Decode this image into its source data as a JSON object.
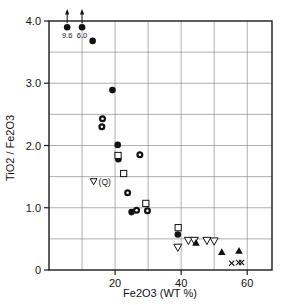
{
  "chart_data": {
    "type": "scatter",
    "title": "",
    "xlabel": "Fe2O3 (WT %)",
    "ylabel": "TiO2 / Fe2O3",
    "xlim": [
      0,
      67.5
    ],
    "ylim": [
      0,
      4.0
    ],
    "xticks": [
      20,
      40,
      60
    ],
    "xticklabels": [
      "20",
      "40",
      "60"
    ],
    "yticks": [
      0,
      1.0,
      2.0,
      3.0,
      4.0
    ],
    "yticklabels": [
      "0",
      "1.0",
      "2.0",
      "3.0",
      "4.0"
    ],
    "grid": "both, major every 10 on x and every 0.5 on y",
    "legend_position": "inside, left-middle",
    "annotations": [
      {
        "text": "9.6",
        "x": 5.5,
        "y": 3.9,
        "note": "off-scale value, arrow up"
      },
      {
        "text": "6.0",
        "x": 10.0,
        "y": 3.9,
        "note": "off-scale value, arrow up"
      },
      {
        "text": "(Q)",
        "x": 13.5,
        "y": 1.42,
        "note": "legend marker open triangle-down"
      }
    ],
    "series": [
      {
        "name": "filled-circle",
        "marker": "filled circle",
        "points": [
          {
            "x": 5.5,
            "y": 3.9
          },
          {
            "x": 10.0,
            "y": 3.9
          },
          {
            "x": 13.2,
            "y": 3.68
          },
          {
            "x": 19.2,
            "y": 2.89
          },
          {
            "x": 20.8,
            "y": 2.01
          },
          {
            "x": 21.0,
            "y": 1.78
          },
          {
            "x": 25.0,
            "y": 0.93
          },
          {
            "x": 39.0,
            "y": 0.57
          }
        ]
      },
      {
        "name": "dotted-circle",
        "marker": "filled circle with white center dot",
        "points": [
          {
            "x": 16.2,
            "y": 2.43
          },
          {
            "x": 16.0,
            "y": 2.3
          },
          {
            "x": 27.5,
            "y": 1.85
          },
          {
            "x": 23.8,
            "y": 1.24
          },
          {
            "x": 26.5,
            "y": 0.96
          },
          {
            "x": 29.8,
            "y": 0.95
          }
        ]
      },
      {
        "name": "open-square",
        "marker": "open square",
        "points": [
          {
            "x": 20.9,
            "y": 1.84
          },
          {
            "x": 22.6,
            "y": 1.55
          },
          {
            "x": 29.3,
            "y": 1.07
          },
          {
            "x": 39.1,
            "y": 0.68
          }
        ]
      },
      {
        "name": "open-triangle-down",
        "marker": "open triangle pointing down",
        "points": [
          {
            "x": 39.0,
            "y": 0.36
          },
          {
            "x": 42.2,
            "y": 0.47
          },
          {
            "x": 44.0,
            "y": 0.47
          },
          {
            "x": 47.8,
            "y": 0.47
          },
          {
            "x": 50.0,
            "y": 0.46
          }
        ]
      },
      {
        "name": "filled-triangle-up",
        "marker": "filled triangle pointing up",
        "points": [
          {
            "x": 44.5,
            "y": 0.44
          },
          {
            "x": 52.3,
            "y": 0.29
          },
          {
            "x": 57.5,
            "y": 0.31
          }
        ]
      },
      {
        "name": "cross",
        "marker": "x cross",
        "points": [
          {
            "x": 55.3,
            "y": 0.11
          },
          {
            "x": 57.4,
            "y": 0.12
          },
          {
            "x": 58.3,
            "y": 0.12
          }
        ]
      }
    ]
  },
  "colors": {
    "marker": "#111111",
    "axis": "#1a1a1a",
    "grid": "#8c8c8c",
    "background": "#ffffff"
  }
}
